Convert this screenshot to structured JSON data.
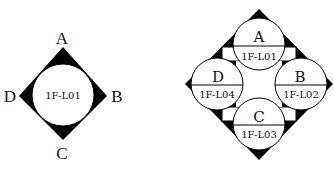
{
  "left_diagram": {
    "center_label": "1F-L01",
    "corners": {
      "top": "A",
      "right": "B",
      "bottom": "C",
      "left": "D"
    }
  },
  "right_diagram": {
    "cells": [
      {
        "position": "top",
        "letter": "A",
        "code": "1F-L01"
      },
      {
        "position": "right",
        "letter": "B",
        "code": "1F-L02"
      },
      {
        "position": "bottom",
        "letter": "C",
        "code": "1F-L03"
      },
      {
        "position": "left",
        "letter": "D",
        "code": "1F-L04"
      }
    ]
  },
  "colors": {
    "fill": "#000000",
    "background": "#ffffff",
    "stroke": "#111111"
  }
}
